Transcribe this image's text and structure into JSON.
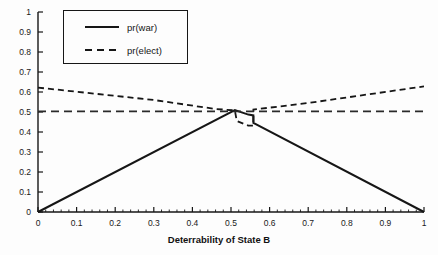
{
  "chart_data": {
    "type": "line",
    "title": "",
    "subtitle": "",
    "xlabel": "Deterrability of State B",
    "ylabel": "",
    "xlim": [
      0,
      1
    ],
    "ylim": [
      0,
      1
    ],
    "grid": false,
    "legend_position": "top-left",
    "xticks": [
      "0",
      "0.1",
      "0.2",
      "0.3",
      "0.4",
      "0.5",
      "0.6",
      "0.7",
      "0.8",
      "0.9",
      "1"
    ],
    "xtick_values": [
      0,
      0.1,
      0.2,
      0.3,
      0.4,
      0.5,
      0.6,
      0.7,
      0.8,
      0.9,
      1
    ],
    "yticks": [
      "0",
      "0.1",
      "0.2",
      "0.3",
      "0.4",
      "0.5",
      "0.6",
      "0.7",
      "0.8",
      "0.9",
      "1"
    ],
    "ytick_values": [
      0,
      0.1,
      0.2,
      0.3,
      0.4,
      0.5,
      0.6,
      0.7,
      0.8,
      0.9,
      1
    ],
    "series": [
      {
        "name": "pr(war)",
        "style": "solid",
        "color": "#161616",
        "points": [
          [
            0.0,
            0.0
          ],
          [
            0.51,
            0.51
          ],
          [
            0.545,
            0.487
          ],
          [
            0.558,
            0.483
          ],
          [
            0.558,
            0.445
          ],
          [
            1.0,
            0.0
          ]
        ]
      },
      {
        "name": "pr(elect)",
        "style": "dashed",
        "color": "#161616",
        "points": [
          [
            0.0,
            0.622
          ],
          [
            0.3,
            0.56
          ],
          [
            0.46,
            0.515
          ],
          [
            0.51,
            0.508
          ],
          [
            0.515,
            0.455
          ],
          [
            0.545,
            0.432
          ],
          [
            0.558,
            0.432
          ],
          [
            0.558,
            0.512
          ],
          [
            0.7,
            0.545
          ],
          [
            1.0,
            0.628
          ]
        ]
      },
      {
        "name": "reference-0.5",
        "style": "dashed",
        "color": "#2a2a2a",
        "points": [
          [
            0.0,
            0.503
          ],
          [
            1.0,
            0.503
          ]
        ]
      }
    ]
  },
  "legend": {
    "items": [
      {
        "label": "pr(war)",
        "style": "solid"
      },
      {
        "label": "pr(elect)",
        "style": "dashed"
      }
    ]
  },
  "axes": {
    "x_title": "Deterrability of State B"
  }
}
